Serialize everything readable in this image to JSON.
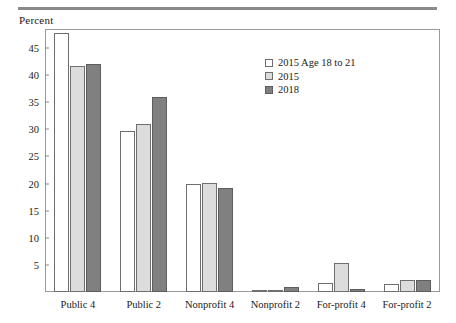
{
  "figure": {
    "axis_title": "Percent",
    "fonts": {
      "base_size": 10.5
    }
  },
  "legend": {
    "entries": [
      {
        "label": "2015 Age 18 to 21",
        "swatch": "white-swatch"
      },
      {
        "label": "2015",
        "swatch": "light-gray-swatch"
      },
      {
        "label": "2018",
        "swatch": "dark-gray-swatch"
      }
    ]
  },
  "colors": {
    "series_2015_age_18_to_21": "#ffffff",
    "series_2015": "#dcdcdc",
    "series_2018": "#808080",
    "bar_outline": "#6f6f6f",
    "frame": "#9a9a9a",
    "top_rule": "#8a8a8a"
  },
  "chart_data": {
    "type": "bar",
    "title": "",
    "subtitle": "",
    "xlabel": "",
    "ylabel": "Percent",
    "ylim": [
      0,
      48.5
    ],
    "yticks": [
      5,
      10,
      15,
      20,
      25,
      30,
      35,
      40,
      45
    ],
    "ytick_labels": [
      "5",
      "10",
      "15",
      "20",
      "25",
      "30",
      "35",
      "40",
      "45"
    ],
    "grid": false,
    "legend_position": "upper-center-right",
    "categories": [
      "Public 4",
      "Public 2",
      "Nonprofit 4",
      "Nonprofit 2",
      "For-profit 4",
      "For-profit 2"
    ],
    "series": [
      {
        "name": "2015 Age 18 to 21",
        "values": [
          47.7,
          29.7,
          19.9,
          0.3,
          1.6,
          1.5
        ]
      },
      {
        "name": "2015",
        "values": [
          41.6,
          30.9,
          20.1,
          0.4,
          5.4,
          2.2
        ]
      },
      {
        "name": "2018",
        "values": [
          42.1,
          35.9,
          19.2,
          0.9,
          0.6,
          2.3
        ]
      }
    ]
  }
}
